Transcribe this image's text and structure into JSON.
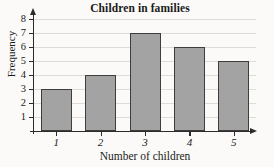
{
  "chart_data": {
    "type": "bar",
    "title": "Children in families",
    "xlabel": "Number of children",
    "ylabel": "Frequency",
    "categories": [
      "1",
      "2",
      "3",
      "4",
      "5"
    ],
    "values": [
      3,
      4,
      7,
      6,
      5
    ],
    "ylim": [
      0,
      8
    ],
    "yticks": [
      1,
      2,
      3,
      4,
      5,
      6,
      7,
      8
    ],
    "ytick_labels": [
      "1",
      "2",
      "3",
      "4",
      "5",
      "6",
      "7",
      "8"
    ],
    "xtick_labels": [
      "1",
      "2",
      "3",
      "4",
      "5"
    ],
    "grid": true,
    "grid_axis": "y",
    "legend": null,
    "series": [
      {
        "name": "Frequency",
        "values": [
          3,
          4,
          7,
          6,
          5
        ]
      }
    ],
    "colors": {
      "bar_fill": "#a3a3a3",
      "bar_edge": "#3d3d3d",
      "gridline": "#dedad6",
      "axis": "#2b2b2b",
      "text": "#1a1a1a",
      "background": "#fbfaf8"
    },
    "axis_arrows": {
      "y_axis_top": true,
      "x_axis_right": true
    }
  }
}
